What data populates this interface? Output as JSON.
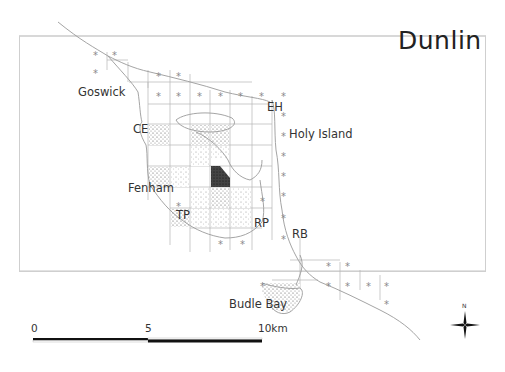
{
  "map": {
    "title": "Dunlin",
    "place_labels": [
      {
        "id": "goswick",
        "text": "Goswick",
        "x": 78,
        "y": 85
      },
      {
        "id": "ce",
        "text": "CE",
        "x": 133,
        "y": 122
      },
      {
        "id": "eh",
        "text": "EH",
        "x": 267,
        "y": 100
      },
      {
        "id": "holy-island",
        "text": "Holy Island",
        "x": 289,
        "y": 127
      },
      {
        "id": "fenham",
        "text": "Fenham",
        "x": 128,
        "y": 181
      },
      {
        "id": "tp",
        "text": "TP",
        "x": 176,
        "y": 208
      },
      {
        "id": "rp",
        "text": "RP",
        "x": 254,
        "y": 216
      },
      {
        "id": "rb",
        "text": "RB",
        "x": 292,
        "y": 227
      },
      {
        "id": "budle-bay",
        "text": "Budle Bay",
        "x": 229,
        "y": 297
      }
    ],
    "scale_bar": {
      "ticks": [
        "0",
        "5",
        "10km"
      ]
    },
    "north_arrow": {
      "label": "N"
    },
    "colors": {
      "frame": "#cfcfcf",
      "coast": "#9a9a9a",
      "grid": "#b0b0b0",
      "stipple_dark": "#222222",
      "asterisk": "#8a8a8a"
    }
  }
}
